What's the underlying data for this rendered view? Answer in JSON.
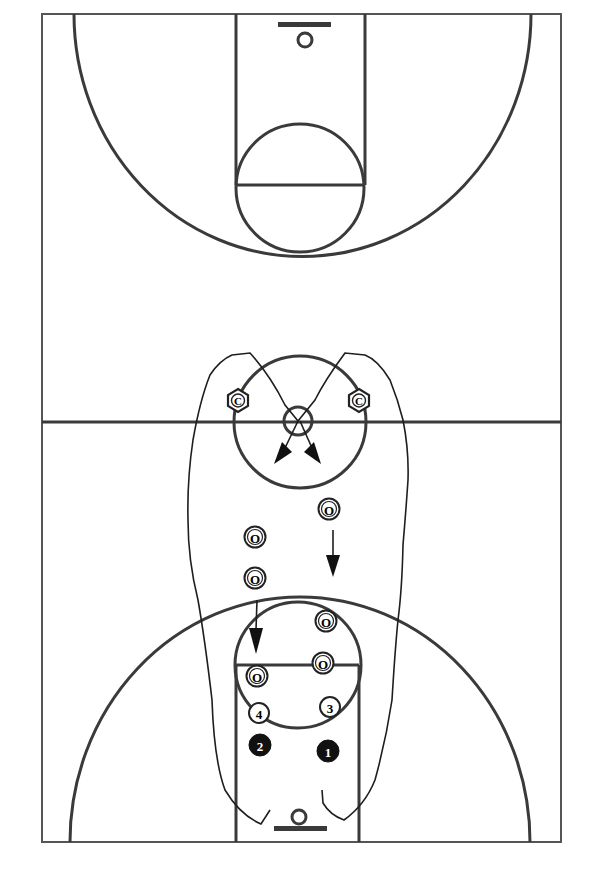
{
  "diagram": {
    "colors": {
      "line": "#3a3a3a",
      "ink": "#1e1e1e",
      "background": "#ffffff",
      "offense_fill": "#111111"
    },
    "court": {
      "boundary": {
        "x": 42,
        "y": 14,
        "width": 519,
        "height": 828
      },
      "midcourt_y": 422
    },
    "defenders_C": [
      {
        "label": "C",
        "x": 238,
        "y": 400
      },
      {
        "label": "C",
        "x": 359,
        "y": 400
      }
    ],
    "defenders_O": [
      {
        "label": "O",
        "x": 329,
        "y": 509
      },
      {
        "label": "O",
        "x": 255,
        "y": 537
      },
      {
        "label": "O",
        "x": 255,
        "y": 578
      },
      {
        "label": "O",
        "x": 326,
        "y": 621
      },
      {
        "label": "O",
        "x": 323,
        "y": 663
      },
      {
        "label": "O",
        "x": 257,
        "y": 676
      }
    ],
    "offense_numbered_open": [
      {
        "label": "4",
        "x": 259,
        "y": 713
      },
      {
        "label": "3",
        "x": 330,
        "y": 707
      }
    ],
    "offense_numbered_filled": [
      {
        "label": "2",
        "x": 260,
        "y": 745
      },
      {
        "label": "1",
        "x": 328,
        "y": 751
      }
    ]
  }
}
